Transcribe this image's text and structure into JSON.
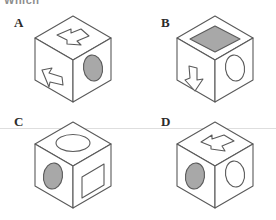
{
  "page": {
    "kind": "spatial-reasoning-cube-question",
    "truncated_header_text": "Which",
    "background_color": "#ffffff",
    "line_color": "#5a5a5a",
    "fill_gray": "#a8a8a8",
    "label_color": "#2b2b2b"
  },
  "options": [
    {
      "id": "A",
      "label": "A",
      "top_face": {
        "symbol": "arrow",
        "direction": "right-down",
        "fill": "none"
      },
      "left_face": {
        "symbol": "arrow",
        "direction": "up-left",
        "fill": "none"
      },
      "right_face": {
        "symbol": "ellipse",
        "direction": "",
        "fill": "#a8a8a8"
      }
    },
    {
      "id": "B",
      "label": "B",
      "top_face": {
        "symbol": "square",
        "direction": "",
        "fill": "#a8a8a8"
      },
      "left_face": {
        "symbol": "arrow",
        "direction": "down",
        "fill": "none"
      },
      "right_face": {
        "symbol": "ellipse",
        "direction": "",
        "fill": "none"
      }
    },
    {
      "id": "C",
      "label": "C",
      "top_face": {
        "symbol": "ellipse",
        "direction": "",
        "fill": "none"
      },
      "left_face": {
        "symbol": "ellipse",
        "direction": "",
        "fill": "#a8a8a8"
      },
      "right_face": {
        "symbol": "square",
        "direction": "",
        "fill": "none"
      }
    },
    {
      "id": "D",
      "label": "D",
      "top_face": {
        "symbol": "arrow",
        "direction": "left-up",
        "fill": "none"
      },
      "left_face": {
        "symbol": "ellipse",
        "direction": "",
        "fill": "#a8a8a8"
      },
      "right_face": {
        "symbol": "ellipse",
        "direction": "",
        "fill": "none"
      }
    }
  ]
}
